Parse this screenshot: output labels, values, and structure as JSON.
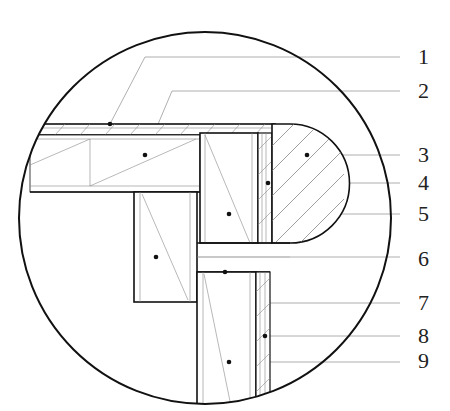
{
  "diagram": {
    "type": "architectural-section-detail",
    "colors": {
      "line": "#111111",
      "leader": "#9a9a9a",
      "background": "#ffffff"
    },
    "callouts": [
      {
        "id": "1",
        "label": "1",
        "y": 59
      },
      {
        "id": "2",
        "label": "2",
        "y": 93
      },
      {
        "id": "3",
        "label": "3",
        "y": 156
      },
      {
        "id": "4",
        "label": "4",
        "y": 184
      },
      {
        "id": "5",
        "label": "5",
        "y": 215
      },
      {
        "id": "6",
        "label": "6",
        "y": 260
      },
      {
        "id": "7",
        "label": "7",
        "y": 304
      },
      {
        "id": "8",
        "label": "8",
        "y": 337
      },
      {
        "id": "9",
        "label": "9",
        "y": 362
      }
    ]
  }
}
